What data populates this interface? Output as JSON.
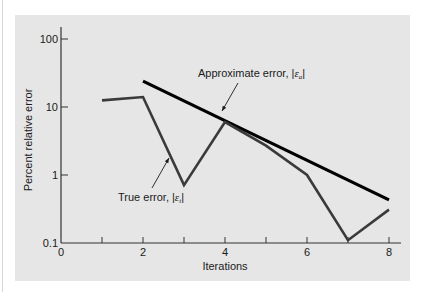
{
  "chart_data": {
    "type": "line",
    "title": "",
    "xlabel": "Iterations",
    "ylabel": "Percent relative error",
    "yscale": "log",
    "xlim": [
      0,
      8.3
    ],
    "ylim": [
      0.1,
      150
    ],
    "x_ticks": [
      0,
      1,
      2,
      3,
      4,
      5,
      6,
      7,
      8
    ],
    "x_tick_labels": [
      "0",
      "",
      "2",
      "",
      "4",
      "",
      "6",
      "",
      "8"
    ],
    "y_ticks": [
      0.1,
      1,
      10,
      100
    ],
    "y_tick_labels": [
      "0.1",
      "1",
      "10",
      "100"
    ],
    "grid": false,
    "legend": "none (inline annotations with arrows)",
    "series": [
      {
        "name": "Approximate error, |εa|",
        "label_text": "Approximate error, |",
        "label_eps": "ε",
        "label_sub": "a",
        "label_close": "|",
        "color": "#000000",
        "x": [
          2,
          8
        ],
        "values": [
          24,
          0.43
        ]
      },
      {
        "name": "True error, |εt|",
        "label_text": "True error, |",
        "label_eps": "ε",
        "label_sub": "t",
        "label_close": "|",
        "color": "#3a3a3a",
        "x": [
          1,
          2,
          3,
          4,
          5,
          6,
          7,
          8
        ],
        "values": [
          12.5,
          14,
          0.71,
          6,
          2.7,
          1.0,
          0.11,
          0.31
        ]
      }
    ]
  },
  "colors": {
    "panel_bg": "#e6e6e6",
    "axis": "#333333",
    "approx_line": "#000000",
    "true_line": "#3a3a3a"
  }
}
